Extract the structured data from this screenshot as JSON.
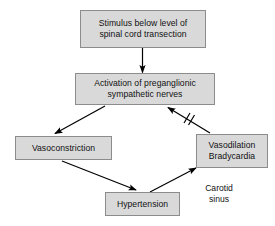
{
  "diagram": {
    "background_color": "#ffffff",
    "node_fill_color": "#d9d9d9",
    "node_border_color": "#8c8c8c",
    "edge_color": "#000000",
    "text_color": "#111111",
    "nodes": [
      {
        "id": "stimulus",
        "label": "Stimulus below level of\nspinal cord transection"
      },
      {
        "id": "activation",
        "label": "Activation of preganglionic\nsympathetic nerves"
      },
      {
        "id": "vasoconstriction",
        "label": "Vasoconstriction"
      },
      {
        "id": "vasodilation",
        "label": "Vasodilation\nBradycardia"
      },
      {
        "id": "hypertension",
        "label": "Hypertension"
      }
    ],
    "labels": [
      {
        "id": "carotid-sinus",
        "label": "Carotid\nsinus"
      }
    ],
    "edges": [
      {
        "id": "stimulus-to-activation",
        "from": "stimulus",
        "to": "activation",
        "kind": "arrow"
      },
      {
        "id": "activation-to-vasoconstriction",
        "from": "activation",
        "to": "vasoconstriction",
        "kind": "arrow"
      },
      {
        "id": "vasoconstriction-to-hypertension",
        "from": "vasoconstriction",
        "to": "hypertension",
        "kind": "arrow"
      },
      {
        "id": "hypertension-to-vasodilation",
        "from": "hypertension",
        "to": "vasodilation",
        "kind": "arrow"
      },
      {
        "id": "vasodilation-to-activation",
        "from": "vasodilation",
        "to": "activation",
        "kind": "inhibition-arrow",
        "marker": "//"
      }
    ]
  }
}
